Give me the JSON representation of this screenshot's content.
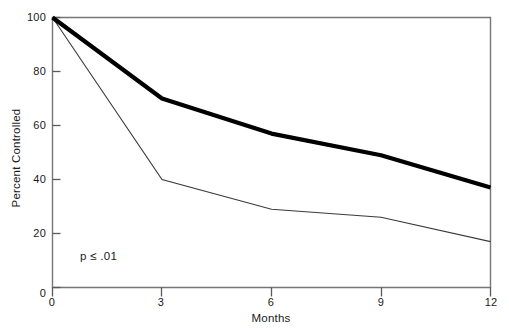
{
  "chart_data": {
    "type": "line",
    "title": "",
    "subtitle": "",
    "xlabel": "Months",
    "ylabel": "Percent Controlled",
    "xlim": [
      0,
      12
    ],
    "ylim": [
      0,
      100
    ],
    "x": [
      0,
      3,
      6,
      9,
      12
    ],
    "xticks": [
      "0",
      "3",
      "6",
      "9",
      "12"
    ],
    "yticks": [
      "0",
      "20",
      "40",
      "60",
      "80",
      "100"
    ],
    "ytick_values": [
      0,
      20,
      40,
      60,
      80,
      100
    ],
    "grid": false,
    "legend": "none",
    "series": [
      {
        "name": "thick-line",
        "x": [
          0,
          3,
          6,
          9,
          12
        ],
        "values": [
          100,
          70,
          57,
          49,
          37
        ],
        "color": "#000000",
        "stroke_width": 4.2
      },
      {
        "name": "thin-line",
        "x": [
          0,
          3,
          6,
          9,
          12
        ],
        "values": [
          100,
          40,
          29,
          26,
          17
        ],
        "color": "#3a3a3a",
        "stroke_width": 1.1
      }
    ],
    "annotations": [
      {
        "text": "p ≤ .01",
        "x": 0.6,
        "y": 12
      }
    ],
    "axis_color": "#6e6e6e",
    "background": "#ffffff"
  },
  "axes": {
    "x_title": "Months",
    "y_title": "Percent Controlled",
    "x_tick_labels": [
      "0",
      "3",
      "6",
      "9",
      "12"
    ],
    "y_tick_labels": [
      "0",
      "20",
      "40",
      "60",
      "80",
      "100"
    ]
  },
  "annotation": {
    "p_value": "p ≤ .01"
  }
}
